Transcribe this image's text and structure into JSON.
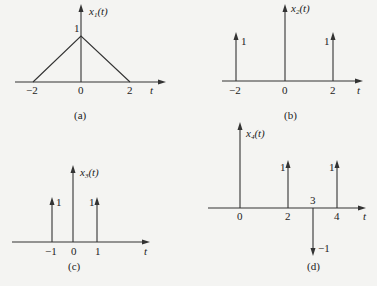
{
  "figure": {
    "panels": [
      {
        "id": "a",
        "caption": "(a)",
        "ylabel": "x",
        "ylabel_sub": "1",
        "ylabel_arg": "(t)",
        "xlabel": "t",
        "ticks": [
          "−2",
          "0",
          "2"
        ],
        "peak_label": "1",
        "type": "triangle",
        "points": [
          [
            -2,
            0
          ],
          [
            0,
            1
          ],
          [
            2,
            0
          ]
        ]
      },
      {
        "id": "b",
        "caption": "(b)",
        "ylabel": "x",
        "ylabel_sub": "2",
        "ylabel_arg": "(t)",
        "xlabel": "t",
        "ticks": [
          "−2",
          "0",
          "2"
        ],
        "impulses": [
          {
            "t": -2,
            "weight": "1"
          },
          {
            "t": 2,
            "weight": "1"
          }
        ]
      },
      {
        "id": "c",
        "caption": "(c)",
        "ylabel": "x",
        "ylabel_sub": "3",
        "ylabel_arg": "(t)",
        "xlabel": "t",
        "ticks": [
          "−1",
          "0",
          "1"
        ],
        "impulses": [
          {
            "t": -1,
            "weight": "1"
          },
          {
            "t": 1,
            "weight": "1"
          }
        ]
      },
      {
        "id": "d",
        "caption": "(d)",
        "ylabel": "x",
        "ylabel_sub": "4",
        "ylabel_arg": "(t)",
        "xlabel": "t",
        "ticks": [
          "0",
          "2",
          "3",
          "4"
        ],
        "impulses": [
          {
            "t": 2,
            "weight": "1"
          },
          {
            "t": 3,
            "weight": "−1"
          },
          {
            "t": 4,
            "weight": "1"
          }
        ]
      }
    ]
  }
}
